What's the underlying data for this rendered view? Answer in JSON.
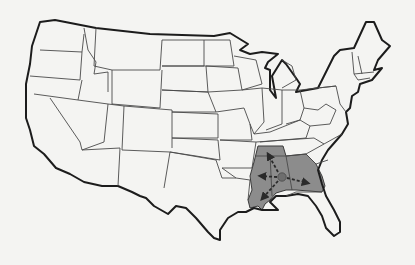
{
  "map": {
    "subject": "United States outline map with highlighted southeastern region",
    "colors": {
      "background": "#f4f4f2",
      "outline": "#1c1c1c",
      "state_border": "#4a4a4a",
      "highlight_fill": "#8c8c8c",
      "center_dot": "#6e6e6e",
      "arrow": "#2a2a2a"
    },
    "highlighted_region": {
      "states": [
        "Tennessee",
        "Mississippi",
        "Alabama",
        "Georgia",
        "Louisiana"
      ],
      "center_marker": "dot",
      "arrows": [
        "north",
        "west",
        "east",
        "southwest"
      ]
    }
  }
}
